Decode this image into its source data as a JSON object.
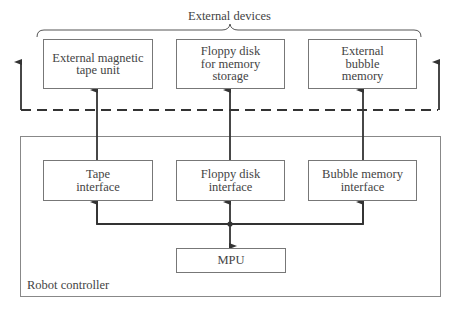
{
  "diagram": {
    "external_group_label": "External devices",
    "controller_label": "Robot controller",
    "external_devices": [
      {
        "label": "External magnetic\ntape unit"
      },
      {
        "label": "Floppy disk\nfor memory\nstorage"
      },
      {
        "label": "External\nbubble\nmemory"
      }
    ],
    "interfaces": [
      {
        "label": "Tape\ninterface"
      },
      {
        "label": "Floppy disk\ninterface"
      },
      {
        "label": "Bubble memory\ninterface"
      }
    ],
    "processor": {
      "label": "MPU"
    },
    "colors": {
      "line": "#333333",
      "box_border": "#777777",
      "text": "#444444"
    }
  }
}
